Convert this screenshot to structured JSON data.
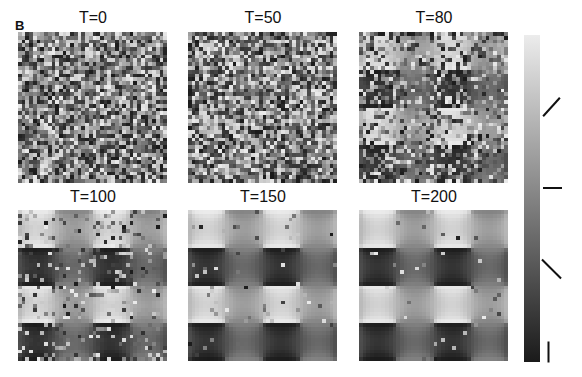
{
  "figure": {
    "panel_label": "B",
    "grid_size": 40,
    "frames": [
      {
        "title": "T=0",
        "noise": 1.0,
        "seed": 11,
        "left": 18,
        "top": 32
      },
      {
        "title": "T=50",
        "noise": 0.92,
        "seed": 23,
        "left": 188,
        "top": 32
      },
      {
        "title": "T=80",
        "noise": 0.45,
        "seed": 37,
        "left": 359,
        "top": 32
      },
      {
        "title": "T=100",
        "noise": 0.18,
        "seed": 41,
        "left": 18,
        "top": 210
      },
      {
        "title": "T=150",
        "noise": 0.04,
        "seed": 53,
        "left": 188,
        "top": 210
      },
      {
        "title": "T=200",
        "noise": 0.02,
        "seed": 67,
        "left": 359,
        "top": 210
      }
    ]
  },
  "colorbar": {
    "top_color": "#ececec",
    "bottom_color": "#1a1a1a",
    "orientation_markers": [
      {
        "icon": "orientation-45-icon",
        "angle_deg": -45,
        "y": 107
      },
      {
        "icon": "orientation-0-icon",
        "angle_deg": 0,
        "y": 188
      },
      {
        "icon": "orientation-135-icon",
        "angle_deg": 45,
        "y": 268
      },
      {
        "icon": "orientation-90-icon",
        "angle_deg": 90,
        "y": 351
      }
    ]
  }
}
